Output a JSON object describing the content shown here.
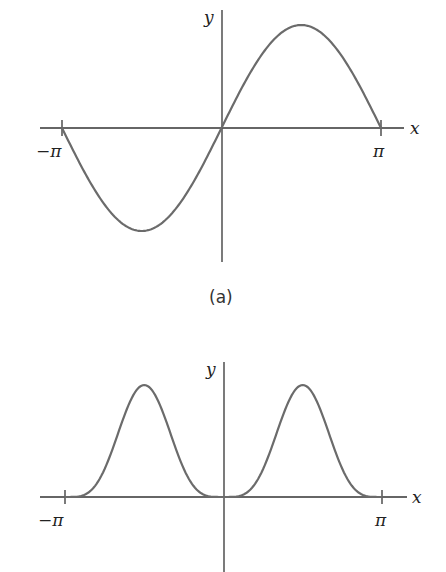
{
  "chart_data": [
    {
      "type": "line",
      "panel": "(a)",
      "function": "sin(x)",
      "xlabel": "x",
      "ylabel": "y",
      "x_ticks": [
        "-π",
        "π"
      ],
      "xlim": [
        -3.14159,
        3.14159
      ],
      "ylim": [
        -1,
        1
      ],
      "grid": false,
      "x": [
        -3.14159,
        -2.3562,
        -1.5708,
        -0.7854,
        0,
        0.7854,
        1.5708,
        2.3562,
        3.14159
      ],
      "values": [
        0,
        -0.707,
        -1,
        -0.707,
        0,
        0.707,
        1,
        0.707,
        0
      ]
    },
    {
      "type": "line",
      "panel": "(b)",
      "function": "sin^4(x)",
      "xlabel": "x",
      "ylabel": "y",
      "x_ticks": [
        "-π",
        "π"
      ],
      "xlim": [
        -3.14159,
        3.14159
      ],
      "ylim": [
        0,
        1
      ],
      "grid": false,
      "x": [
        -3.14159,
        -2.3562,
        -1.5708,
        -0.7854,
        0,
        0.7854,
        1.5708,
        2.3562,
        3.14159
      ],
      "values": [
        0,
        0.25,
        1,
        0.25,
        0,
        0.25,
        1,
        0.25,
        0
      ]
    }
  ],
  "panel_a": {
    "x_label": "x",
    "y_label": "y",
    "tick_neg": "−π",
    "tick_pos": "π",
    "caption": "(a)",
    "curve_color": "#6b6b6b"
  },
  "panel_b": {
    "x_label": "x",
    "y_label": "y",
    "tick_neg": "−π",
    "tick_pos": "π",
    "curve_color": "#6b6b6b"
  }
}
